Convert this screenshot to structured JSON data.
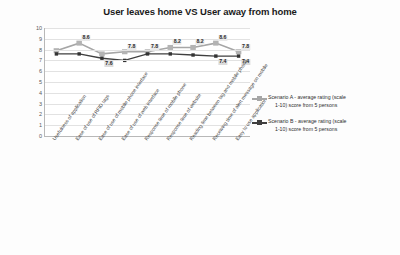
{
  "chart_data": {
    "type": "line",
    "title": "User leaves home VS User away from home",
    "xlabel": "",
    "ylabel": "",
    "ylim": [
      0,
      10
    ],
    "yticks": [
      10,
      9,
      8,
      7,
      6,
      5,
      4,
      3,
      2,
      1,
      0
    ],
    "grid": true,
    "legend_position": "right",
    "categories": [
      "Usefulness of application",
      "Ease of use of RFID tags",
      "Ease of use of mobile phone interface",
      "Ease of use of web interface",
      "Response time of mobile phone",
      "Response time of website",
      "Reading time between tag and mobile phone",
      "Receiving time of alert message on mobile",
      "Easy to use application"
    ],
    "series": [
      {
        "name": "Scenario A - average rating (scale 1-10) score from 5 persons",
        "color": "#a6a6a6",
        "values": [
          7.9,
          8.6,
          7.6,
          7.8,
          7.8,
          8.2,
          8.2,
          8.6,
          7.8
        ]
      },
      {
        "name": "Scenario B - average rating (scale 1-10) score from 5 persons",
        "color": "#3f3f3f",
        "values": [
          7.6,
          7.6,
          7.2,
          7.0,
          7.6,
          7.6,
          7.5,
          7.4,
          7.4
        ]
      }
    ],
    "data_labels": [
      {
        "text": "8.6",
        "series": "A",
        "index": 1
      },
      {
        "text": "7.6",
        "series": "B",
        "index": 2
      },
      {
        "text": "7.8",
        "series": "A",
        "index": 3
      },
      {
        "text": "7.8",
        "series": "A",
        "index": 4
      },
      {
        "text": "8.2",
        "series": "A",
        "index": 5
      },
      {
        "text": "8.2",
        "series": "A",
        "index": 6
      },
      {
        "text": "7.4",
        "series": "B",
        "index": 7
      },
      {
        "text": "8.6",
        "series": "A",
        "index": 7
      },
      {
        "text": "7.8",
        "series": "A",
        "index": 8
      },
      {
        "text": "7.4",
        "series": "B",
        "index": 8
      }
    ]
  },
  "legend": {
    "items": [
      {
        "line1": "Scenario A - average rating (scale",
        "line2": "1-10) score from 5 persons",
        "color": "#a6a6a6"
      },
      {
        "line1": "Scenario B - average rating (scale",
        "line2": "1-10) score from 5 persons",
        "color": "#3f3f3f"
      }
    ]
  }
}
